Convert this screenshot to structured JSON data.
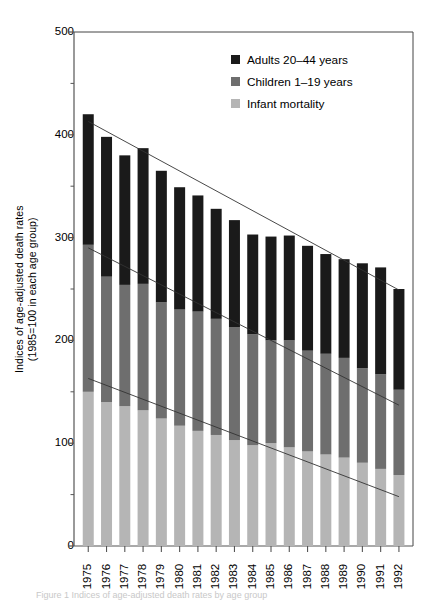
{
  "figure": {
    "ylabel_line1": "Indices of age-adjusted death rates",
    "ylabel_line2": "(1985=100 in each age group)",
    "caption": "Figure 1  Indices of age-adjusted death rates by age group"
  },
  "legend": {
    "position": "top-right",
    "items": [
      {
        "label": "Adults 20–44 years",
        "color": "#1a1a1a",
        "key": "adults"
      },
      {
        "label": "Children 1–19 years",
        "color": "#6e6e6e",
        "key": "children"
      },
      {
        "label": "Infant mortality",
        "color": "#b5b5b5",
        "key": "infant"
      }
    ]
  },
  "chart_data": {
    "type": "bar",
    "subtype": "stacked-bar-with-trendlines",
    "title": "",
    "xlabel": "",
    "ylabel": "Indices of age-adjusted death rates (1985=100 in each age group)",
    "ylim": [
      0,
      500
    ],
    "yticks": [
      0,
      100,
      200,
      300,
      400,
      500
    ],
    "yticklabels": [
      "0",
      "100",
      "200",
      "300",
      "400",
      "500"
    ],
    "yminorticks": [
      50,
      150,
      250,
      350,
      450
    ],
    "grid": false,
    "categories": [
      "1975",
      "1976",
      "1977",
      "1978",
      "1979",
      "1980",
      "1981",
      "1982",
      "1983",
      "1984",
      "1985",
      "1986",
      "1987",
      "1988",
      "1989",
      "1990",
      "1991",
      "1992"
    ],
    "series": [
      {
        "name": "Infant mortality",
        "color": "#b5b5b5",
        "values": [
          150,
          140,
          136,
          132,
          124,
          117,
          112,
          108,
          103,
          98,
          100,
          96,
          92,
          89,
          86,
          81,
          75,
          69
        ]
      },
      {
        "name": "Children 1–19 years",
        "color": "#6e6e6e",
        "values": [
          143,
          122,
          118,
          123,
          113,
          113,
          116,
          113,
          110,
          108,
          100,
          104,
          98,
          98,
          97,
          92,
          92,
          83
        ]
      },
      {
        "name": "Adults 20–44 years",
        "color": "#1a1a1a",
        "values": [
          127,
          136,
          126,
          132,
          128,
          119,
          113,
          107,
          104,
          97,
          101,
          102,
          102,
          97,
          96,
          102,
          104,
          98
        ]
      }
    ],
    "totals": [
      420,
      398,
      380,
      387,
      365,
      349,
      341,
      328,
      317,
      303,
      301,
      302,
      292,
      284,
      279,
      275,
      271,
      250
    ],
    "trendlines": [
      {
        "name": "infant-trend",
        "x0": "1975",
        "y0": 163,
        "x1": "1992",
        "y1": 48
      },
      {
        "name": "children-trend",
        "x0": "1975",
        "y0": 290,
        "x1": "1992",
        "y1": 137
      },
      {
        "name": "adults-trend",
        "x0": "1975",
        "y0": 413,
        "x1": "1992",
        "y1": 249
      }
    ]
  }
}
